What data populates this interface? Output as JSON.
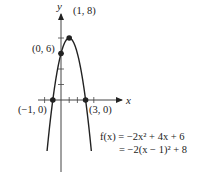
{
  "figure": {
    "axes": {
      "x_label": "x",
      "y_label": "y",
      "x_ticks": [
        -2,
        -1,
        1,
        2,
        3,
        4
      ],
      "y_ticks": [
        2,
        4,
        6,
        8
      ]
    },
    "function": {
      "a": -2,
      "b": 4,
      "c": 6,
      "x_range": [
        -1.7,
        3.7
      ]
    },
    "points": [
      {
        "x": 1,
        "y": 8,
        "label": "(1, 8)"
      },
      {
        "x": 0,
        "y": 6,
        "label": "(0, 6)"
      },
      {
        "x": -1,
        "y": 0,
        "label": "(−1, 0)"
      },
      {
        "x": 3,
        "y": 0,
        "label": "(3, 0)"
      }
    ],
    "equation": {
      "line1": "f(x) = −2x² + 4x + 6",
      "line2": "= −2(x − 1)² + 8"
    },
    "colors": {
      "ink": "#222222",
      "background": "#ffffff"
    }
  }
}
